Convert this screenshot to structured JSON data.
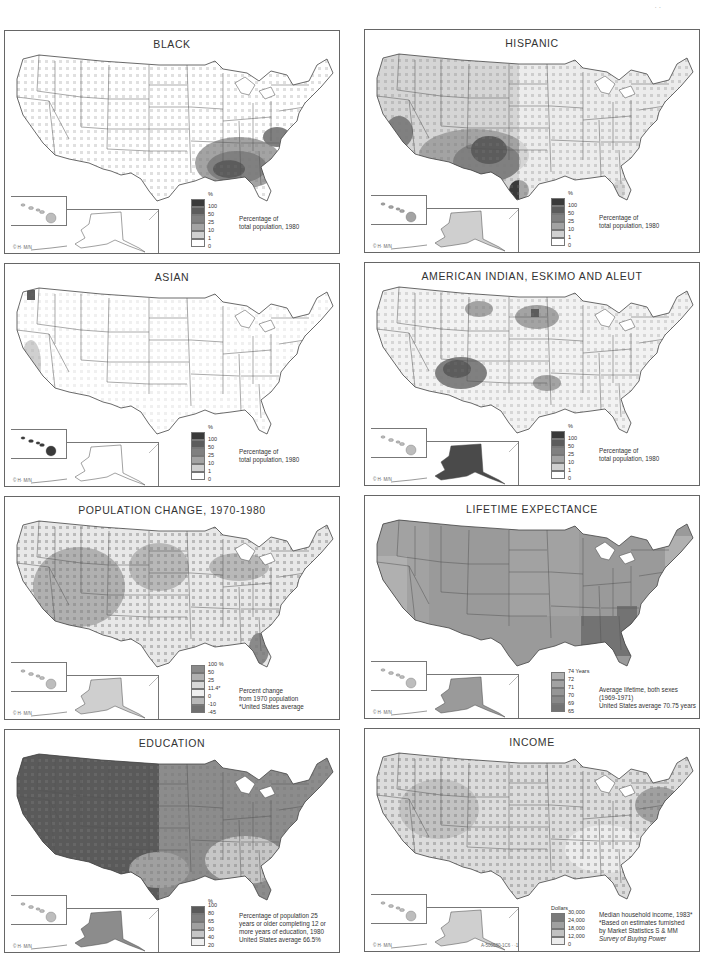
{
  "page": {
    "corner_mark": "· ·"
  },
  "panels": [
    {
      "id": "black",
      "title": "BLACK",
      "legend": {
        "unit": "%",
        "ticks": [
          "100",
          "50",
          "25",
          "10",
          "1",
          "0"
        ],
        "colors": [
          "#3a3a3a",
          "#5c5c5c",
          "#808080",
          "#a3a3a3",
          "#d0d0d0",
          "#ffffff"
        ]
      },
      "caption": [
        "Percentage of",
        "total population, 1980"
      ],
      "copyright": "© H· M/N",
      "base_fill": "#ffffff",
      "hotspot": "southeast"
    },
    {
      "id": "hispanic",
      "title": "HISPANIC",
      "legend": {
        "unit": "%",
        "ticks": [
          "100",
          "50",
          "25",
          "10",
          "1",
          "0"
        ],
        "colors": [
          "#3a3a3a",
          "#5c5c5c",
          "#808080",
          "#a3a3a3",
          "#d0d0d0",
          "#ffffff"
        ]
      },
      "caption": [
        "Percentage of",
        "total population, 1980"
      ],
      "copyright": "© H· M/N",
      "base_fill": "#d5d5d5",
      "hotspot": "southwest"
    },
    {
      "id": "asian",
      "title": "ASIAN",
      "legend": {
        "unit": "%",
        "ticks": [
          "100",
          "50",
          "25",
          "10",
          "1",
          "0"
        ],
        "colors": [
          "#3a3a3a",
          "#5c5c5c",
          "#808080",
          "#a3a3a3",
          "#d0d0d0",
          "#ffffff"
        ]
      },
      "caption": [
        "Percentage of",
        "total population, 1980"
      ],
      "copyright": "© H· M/N",
      "base_fill": "#ffffff",
      "hotspot": "westcoast"
    },
    {
      "id": "american-indian",
      "title": "AMERICAN INDIAN, ESKIMO AND ALEUT",
      "legend": {
        "unit": "%",
        "ticks": [
          "100",
          "50",
          "25",
          "10",
          "1",
          "0"
        ],
        "colors": [
          "#3a3a3a",
          "#5c5c5c",
          "#808080",
          "#a3a3a3",
          "#d0d0d0",
          "#ffffff"
        ]
      },
      "caption": [
        "Percentage of",
        "total population, 1980"
      ],
      "copyright": "© H· M/N",
      "base_fill": "#f2f2f2",
      "hotspot": "fourcorners"
    },
    {
      "id": "population-change",
      "title": "POPULATION CHANGE, 1970-1980",
      "legend": {
        "unit": "",
        "ticks": [
          "100 %",
          "50",
          "25",
          "11.4*",
          "0",
          "-10",
          "-45"
        ],
        "colors": [
          "#8a8a8a",
          "#b0b0b0",
          "#d8d8d8",
          "#efefef",
          "#b8b8b8",
          "#707070"
        ]
      },
      "caption": [
        "Percent change",
        "from 1970 population",
        "*United States average"
      ],
      "copyright": "© H· M/N",
      "base_fill": "#e8e8e8",
      "hotspot": "west"
    },
    {
      "id": "lifetime-expectance",
      "title": "LIFETIME EXPECTANCE",
      "legend": {
        "unit": "",
        "ticks": [
          "74 Years",
          "72",
          "71",
          "70",
          "69",
          "65"
        ],
        "colors": [
          "#b0b0b0",
          "#a2a2a2",
          "#959595",
          "#888888",
          "#737373"
        ]
      },
      "caption": [
        "Average lifetime, both sexes",
        "(1969-1971)",
        "United States average 70.75 years"
      ],
      "copyright": "© H· M/N",
      "base_fill": "#9a9a9a",
      "hotspot": "states"
    },
    {
      "id": "education",
      "title": "EDUCATION",
      "legend": {
        "unit": "%",
        "ticks": [
          "100",
          "80",
          "65",
          "50",
          "40",
          "20"
        ],
        "colors": [
          "#5a5a5a",
          "#7e7e7e",
          "#a0a0a0",
          "#c6c6c6",
          "#f0f0f0"
        ]
      },
      "caption": [
        "Percentage of population 25",
        "years or older completing 12 or",
        "more years of education, 1980",
        "United States average 66.5%"
      ],
      "copyright": "© H· M/N",
      "base_fill": "#8c8c8c",
      "hotspot": "education"
    },
    {
      "id": "income",
      "title": "INCOME",
      "legend": {
        "unit": "Dollars",
        "ticks": [
          "30,000",
          "24,000",
          "18,000",
          "12,000",
          "0"
        ],
        "colors": [
          "#7a7a7a",
          "#a0a0a0",
          "#c2c2c2",
          "#ececec"
        ]
      },
      "caption": [
        "Median household income, 1983*",
        "*Based on estimates furnished",
        "by Market Statistics S & MM",
        "Survey of Buying Power"
      ],
      "copyright": "© H· M/N",
      "code_mark": "A-500580-1C6   ·  ·1",
      "base_fill": "#dcdcdc",
      "hotspot": "income"
    }
  ]
}
